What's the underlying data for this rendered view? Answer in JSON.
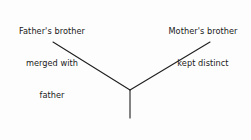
{
  "diagram": {
    "type": "kinship-chart",
    "background_color": "#fdfdfd",
    "line_color": "#1f1f1f",
    "text_color": "#1a1a1a",
    "labels": {
      "left_branch": {
        "lines": [
          "Father's brother",
          "merged with",
          "father"
        ]
      },
      "right_branch": {
        "lines": [
          "Mother's brother",
          "kept distinct"
        ]
      },
      "root": {
        "lines": [
          "Ego (Speaker)"
        ]
      }
    },
    "edges": [
      {
        "name": "left-branch-line",
        "x1": 53,
        "y1": 42,
        "x2": 130,
        "y2": 90
      },
      {
        "name": "right-branch-line",
        "x1": 210,
        "y1": 42,
        "x2": 130,
        "y2": 90
      },
      {
        "name": "ego-stem-line",
        "x1": 130,
        "y1": 90,
        "x2": 130,
        "y2": 118
      }
    ],
    "junction": {
      "x": 130,
      "y": 90
    }
  }
}
